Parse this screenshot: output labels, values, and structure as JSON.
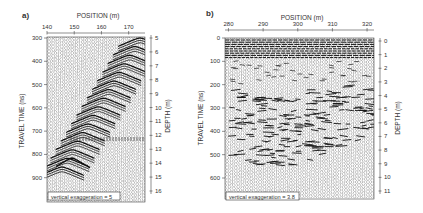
{
  "chart_data": [
    {
      "type": "heatmap",
      "panel_label": "a)",
      "title": "POSITION (m)",
      "xlabel": "POSITION (m)",
      "ylabel": "TRAVEL TIME (ns)",
      "y2label": "DEPTH (m)",
      "x_ticks": [
        140,
        150,
        160,
        170
      ],
      "x_range": [
        140,
        176
      ],
      "y_ticks": [
        300,
        400,
        500,
        600,
        700,
        800,
        900
      ],
      "y_range": [
        300,
        1000
      ],
      "y2_ticks": [
        5,
        6,
        7,
        8,
        9,
        10,
        11,
        12,
        13,
        14,
        15,
        16
      ],
      "annotation": "vertical exaggeration = 5",
      "features": "Dipping stack of diffraction hyperbolas rising from lower-left (~145 m, 850 ns) to upper-right (~172 m, 300 ns); horizontal reflector near 730 ns",
      "grid": false
    },
    {
      "type": "heatmap",
      "panel_label": "b)",
      "title": "POSITION (m)",
      "xlabel": "POSITION (m)",
      "ylabel": "TRAVEL TIME (ns)",
      "y2label": "DEPTH (m)",
      "x_ticks": [
        280,
        290,
        300,
        310,
        320
      ],
      "x_range": [
        279,
        322
      ],
      "y_ticks": [
        0,
        100,
        200,
        300,
        400,
        500,
        600
      ],
      "y_range": [
        0,
        690
      ],
      "y2_ticks": [
        0,
        1,
        2,
        3,
        4,
        5,
        6,
        7,
        8,
        9,
        10,
        11
      ],
      "annotation": "vertical exaggeration = 3.8",
      "features": "Strong horizontal banding 0-60 ns; chaotic reflections 200-500 ns; quiet traces below 500 ns",
      "grid": false
    }
  ],
  "panels": {
    "a": {
      "label": "a)",
      "x_title": "POSITION (m)",
      "y_title": "TRAVEL TIME (ns)",
      "y2_title": "DEPTH (m)",
      "x_ticks": [
        "140",
        "150",
        "160",
        "170"
      ],
      "y_ticks": [
        "300",
        "400",
        "500",
        "600",
        "700",
        "800",
        "900"
      ],
      "y2_ticks": [
        "5",
        "6",
        "7",
        "8",
        "9",
        "10",
        "11",
        "12",
        "13",
        "14",
        "15",
        "16"
      ],
      "annotation": "vertical exaggeration = 5"
    },
    "b": {
      "label": "b)",
      "x_title": "POSITION (m)",
      "y_title": "TRAVEL TIME (ns)",
      "y2_title": "DEPTH (m)",
      "x_ticks": [
        "280",
        "290",
        "300",
        "310",
        "320"
      ],
      "y_ticks": [
        "0",
        "100",
        "200",
        "300",
        "400",
        "500",
        "600"
      ],
      "y2_ticks": [
        "0",
        "1",
        "2",
        "3",
        "4",
        "5",
        "6",
        "7",
        "8",
        "9",
        "10",
        "11"
      ],
      "annotation": "vertical exaggeration = 3.8"
    }
  },
  "colors": {
    "ink": "#222222",
    "trace": "#555555",
    "background": "#ffffff"
  }
}
